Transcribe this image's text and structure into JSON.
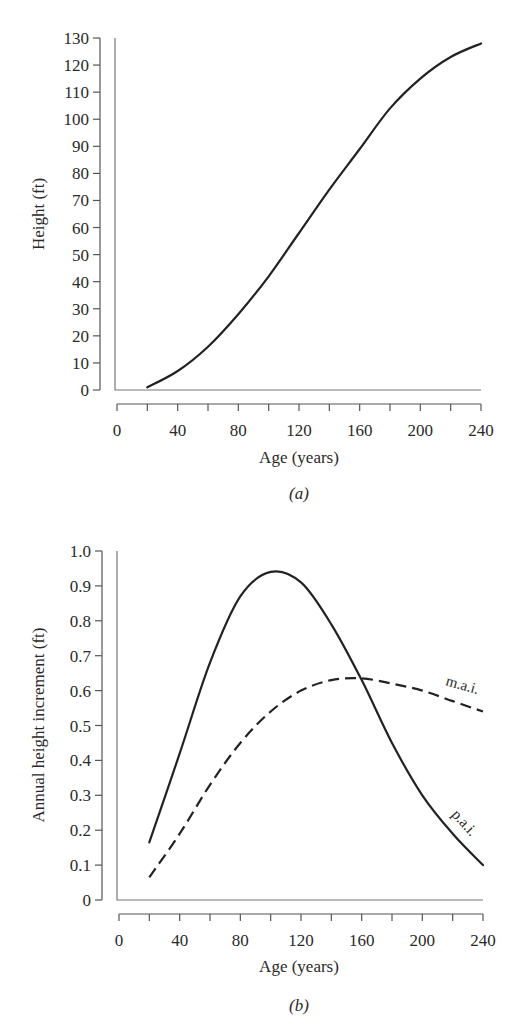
{
  "chart_data": [
    {
      "type": "line",
      "panel": "a",
      "caption": "(a)",
      "title": "",
      "xlabel": "Age (years)",
      "ylabel": "Height (ft)",
      "xlim": [
        0,
        240
      ],
      "ylim": [
        0,
        130
      ],
      "x_ticks": [
        0,
        40,
        80,
        120,
        160,
        200,
        240
      ],
      "x_minor_step": 20,
      "y_ticks": [
        0,
        10,
        20,
        30,
        40,
        50,
        60,
        70,
        80,
        90,
        100,
        110,
        120,
        130
      ],
      "grid": false,
      "legend": null,
      "x": [
        20,
        40,
        60,
        80,
        100,
        120,
        140,
        160,
        180,
        200,
        220,
        240
      ],
      "series": [
        {
          "name": "Height",
          "style": "solid",
          "values": [
            1,
            7,
            16,
            28,
            42,
            58,
            74,
            89,
            104,
            115,
            123,
            128
          ]
        }
      ]
    },
    {
      "type": "line",
      "panel": "b",
      "caption": "(b)",
      "title": "",
      "xlabel": "Age (years)",
      "ylabel": "Annual height increment (ft)",
      "xlim": [
        0,
        240
      ],
      "ylim": [
        0,
        1.0
      ],
      "x_ticks": [
        0,
        40,
        80,
        120,
        160,
        200,
        240
      ],
      "x_minor_step": 20,
      "y_ticks": [
        0,
        0.1,
        0.2,
        0.3,
        0.4,
        0.5,
        0.6,
        0.7,
        0.8,
        0.9,
        1.0
      ],
      "grid": false,
      "legend": "inline labels at curve ends",
      "x": [
        20,
        40,
        60,
        80,
        100,
        120,
        140,
        160,
        180,
        200,
        220,
        240
      ],
      "series": [
        {
          "name": "p.a.i.",
          "style": "solid",
          "values": [
            0.165,
            0.42,
            0.68,
            0.87,
            0.94,
            0.91,
            0.79,
            0.63,
            0.45,
            0.3,
            0.19,
            0.1
          ]
        },
        {
          "name": "m.a.i.",
          "style": "dashed",
          "values": [
            0.065,
            0.19,
            0.33,
            0.45,
            0.54,
            0.6,
            0.63,
            0.635,
            0.62,
            0.6,
            0.57,
            0.54
          ]
        }
      ]
    }
  ],
  "labels": {
    "a": {
      "ylabel": "Height (ft)",
      "xlabel": "Age (years)",
      "caption": "(a)",
      "xticks": [
        "0",
        "40",
        "80",
        "120",
        "160",
        "200",
        "240"
      ],
      "yticks": [
        "0",
        "10",
        "20",
        "30",
        "40",
        "50",
        "60",
        "70",
        "80",
        "90",
        "100",
        "110",
        "120",
        "130"
      ]
    },
    "b": {
      "ylabel": "Annual height increment (ft)",
      "xlabel": "Age (years)",
      "caption": "(b)",
      "xticks": [
        "0",
        "40",
        "80",
        "120",
        "160",
        "200",
        "240"
      ],
      "yticks": [
        "0",
        "0.1",
        "0.2",
        "0.3",
        "0.4",
        "0.5",
        "0.6",
        "0.7",
        "0.8",
        "0.9",
        "1.0"
      ],
      "mai_label": "m.a.i.",
      "pai_label": "p.a.i."
    }
  }
}
